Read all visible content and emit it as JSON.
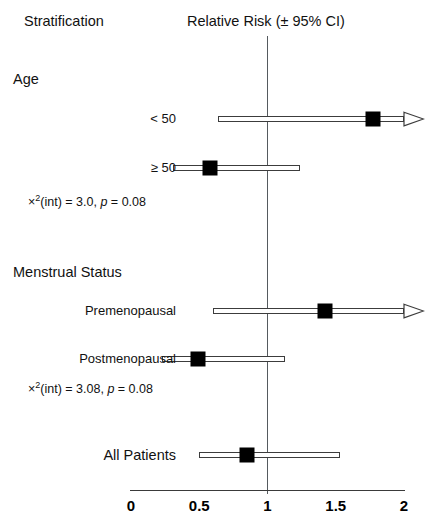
{
  "headers": {
    "stratification": "Stratification",
    "relative_risk": "Relative Risk (± 95% CI)"
  },
  "groups": [
    {
      "name": "age",
      "label": "Age"
    },
    {
      "name": "menstrual-status",
      "label": "Menstrual Status"
    }
  ],
  "stats": [
    {
      "name": "age-interaction",
      "chi": "×",
      "sup": "2",
      "rest": "(int) = 3.0, ",
      "p_italic": "p",
      "tail": " = 0.08"
    },
    {
      "name": "menstrual-interaction",
      "chi": "×",
      "sup": "2",
      "rest": "(int) = 3.08, ",
      "p_italic": "p",
      "tail": " = 0.08"
    }
  ],
  "rows": [
    {
      "name": "age-under-50",
      "label": "< 50",
      "rr": 1.77,
      "ci_low": 0.64,
      "ci_high": 2.0,
      "truncated_high": true
    },
    {
      "name": "age-50-and-over",
      "label": "≥ 50",
      "rr": 0.58,
      "ci_low": 0.31,
      "ci_high": 1.24,
      "truncated_high": false
    },
    {
      "name": "premenopausal",
      "label": "Premenopausal",
      "rr": 1.42,
      "ci_low": 0.6,
      "ci_high": 2.0,
      "truncated_high": true
    },
    {
      "name": "postmenopausal",
      "label": "Postmenopausal",
      "rr": 0.49,
      "ci_low": 0.23,
      "ci_high": 1.13,
      "truncated_high": false
    },
    {
      "name": "all-patients",
      "label": "All Patients",
      "rr": 0.85,
      "ci_low": 0.5,
      "ci_high": 1.53,
      "truncated_high": false
    }
  ],
  "axis": {
    "ticks": [
      "0",
      "0.5",
      "1",
      "1.5",
      "2"
    ],
    "tick_values": [
      0,
      0.5,
      1,
      1.5,
      2
    ],
    "min": 0,
    "max": 2,
    "reference_value": 1
  },
  "colors": {
    "marker": "#000000",
    "ci_line": "#3c3c3c",
    "reference_line": "#555a5e",
    "axis": "#3a3a3a",
    "text": "#111111",
    "background": "#ffffff"
  },
  "chart_data": {
    "type": "scatter",
    "title": "Relative Risk (± 95% CI)",
    "subtitle": "Stratification",
    "xlabel": "",
    "ylabel": "",
    "xlim": [
      0,
      2
    ],
    "grid": false,
    "legend": "none",
    "reference_line": 1,
    "categories": [
      "< 50",
      "≥ 50",
      "Premenopausal",
      "Postmenopausal",
      "All Patients"
    ],
    "values": [
      1.77,
      0.58,
      1.42,
      0.49,
      0.85
    ],
    "ci_low": [
      0.64,
      0.31,
      0.6,
      0.23,
      0.5
    ],
    "ci_high": [
      2.0,
      1.24,
      2.0,
      1.13,
      1.53
    ],
    "ci_high_truncated": [
      true,
      false,
      true,
      false,
      false
    ],
    "annotations": [
      "×²(int) = 3.0, p = 0.08",
      "×²(int) = 3.08, p = 0.08"
    ],
    "xticks": [
      0,
      0.5,
      1,
      1.5,
      2
    ],
    "xticklabels": [
      "0",
      "0.5",
      "1",
      "1.5",
      "2"
    ]
  },
  "layout": {
    "row_y": [
      119,
      168,
      311,
      359,
      455
    ],
    "label_y": [
      112,
      161,
      304,
      352,
      448
    ],
    "stat_y": [
      194,
      381
    ],
    "x0_px": 131,
    "x_per_unit": 136.5
  }
}
